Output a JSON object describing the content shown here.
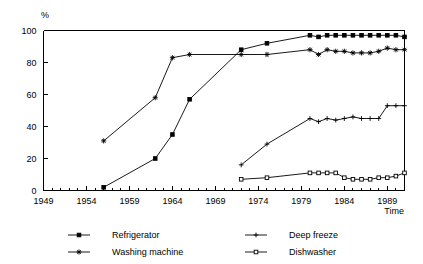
{
  "chart_data": {
    "type": "line",
    "title": "",
    "xlabel": "Time",
    "ylabel": "%",
    "xlim": [
      1949,
      1991
    ],
    "ylim": [
      0,
      100
    ],
    "grid": false,
    "legend_position": "bottom",
    "x_ticks": [
      1949,
      1954,
      1959,
      1964,
      1969,
      1974,
      1979,
      1984,
      1989
    ],
    "x_tick_labels": [
      "1949",
      "1954",
      "1959",
      "1964",
      "1969",
      "1974",
      "1979",
      "1984",
      "1989"
    ],
    "x_minor_tick_step": 1,
    "y_ticks": [
      0,
      20,
      40,
      60,
      80,
      100
    ],
    "y_tick_labels": [
      "0",
      "20",
      "40",
      "60",
      "80",
      "100"
    ],
    "series": [
      {
        "name": "Refrigerator",
        "marker": "filled-square",
        "x": [
          1956,
          1962,
          1964,
          1966,
          1972,
          1975,
          1980,
          1981,
          1982,
          1983,
          1984,
          1985,
          1986,
          1987,
          1988,
          1989,
          1990,
          1991
        ],
        "values": [
          2,
          20,
          35,
          57,
          88,
          92,
          97,
          96,
          97,
          97,
          97,
          97,
          97,
          97,
          97,
          97,
          97,
          96
        ]
      },
      {
        "name": "Washing machine",
        "marker": "asterisk",
        "x": [
          1956,
          1962,
          1964,
          1966,
          1972,
          1975,
          1980,
          1981,
          1982,
          1983,
          1984,
          1985,
          1986,
          1987,
          1988,
          1989,
          1990,
          1991
        ],
        "values": [
          31,
          58,
          83,
          85,
          85,
          85,
          88,
          85,
          88,
          87,
          87,
          86,
          86,
          86,
          87,
          89,
          88,
          88
        ]
      },
      {
        "name": "Deep freeze",
        "marker": "plus",
        "x": [
          1972,
          1975,
          1980,
          1981,
          1982,
          1983,
          1984,
          1985,
          1986,
          1987,
          1988,
          1989,
          1990,
          1991
        ],
        "values": [
          16,
          29,
          45,
          43,
          45,
          44,
          45,
          46,
          45,
          45,
          45,
          53,
          53,
          53
        ]
      },
      {
        "name": "Dishwasher",
        "marker": "open-square",
        "x": [
          1972,
          1975,
          1980,
          1981,
          1982,
          1983,
          1984,
          1985,
          1986,
          1987,
          1988,
          1989,
          1990,
          1991
        ],
        "values": [
          7,
          8,
          11,
          11,
          11,
          11,
          8,
          7,
          7,
          7,
          8,
          8,
          9,
          11
        ]
      }
    ]
  },
  "axes": {
    "y_axis_title": "%",
    "x_axis_title": "Time"
  },
  "legend": {
    "items": [
      {
        "label": "Refrigerator",
        "marker": "filled-square"
      },
      {
        "label": "Washing machine",
        "marker": "asterisk"
      },
      {
        "label": "Deep freeze",
        "marker": "plus"
      },
      {
        "label": "Dishwasher",
        "marker": "open-square"
      }
    ]
  },
  "colors": {
    "ink": "#000000",
    "background": "#ffffff"
  }
}
